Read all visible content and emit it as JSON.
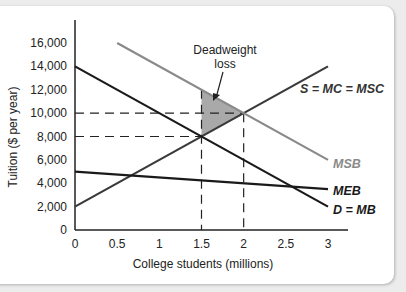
{
  "chart_data": {
    "type": "line",
    "title": "",
    "xlabel": "College students (millions)",
    "ylabel": "Tuition ($ per year)",
    "xlim": [
      0,
      3
    ],
    "ylim": [
      0,
      16000
    ],
    "x_ticks": [
      "0",
      "0.5",
      "1",
      "1.5",
      "2",
      "2.5",
      "3"
    ],
    "y_ticks": [
      "0",
      "2,000",
      "4,000",
      "6,000",
      "8,000",
      "10,000",
      "12,000",
      "14,000",
      "16,000"
    ],
    "grid": false,
    "series": [
      {
        "name": "S = MC = MSC",
        "color": "#3a3a3a",
        "points": [
          [
            0,
            2000
          ],
          [
            3,
            14000
          ]
        ]
      },
      {
        "name": "D = MB",
        "color": "#1a1a1a",
        "points": [
          [
            0,
            14000
          ],
          [
            3,
            2000
          ]
        ]
      },
      {
        "name": "MSB",
        "color": "#8a8a8a",
        "points": [
          [
            0.5,
            16000
          ],
          [
            3,
            6000
          ]
        ]
      },
      {
        "name": "MEB",
        "color": "#1a1a1a",
        "points": [
          [
            0,
            5000
          ],
          [
            3,
            3500
          ]
        ]
      }
    ],
    "reference_lines": [
      {
        "type": "vertical",
        "x": 1.5,
        "style": "dashed"
      },
      {
        "type": "vertical",
        "x": 2,
        "style": "dashed"
      },
      {
        "type": "horizontal",
        "y": 10000,
        "style": "dashed"
      },
      {
        "type": "horizontal",
        "y": 8000,
        "style": "dashed"
      }
    ],
    "shaded_region": {
      "name": "Deadweight loss",
      "points": [
        [
          1.5,
          12000
        ],
        [
          2,
          10000
        ],
        [
          1.5,
          8000
        ]
      ]
    },
    "annotations": [
      {
        "text": "Deadweight loss",
        "points_to": [
          1.7,
          10500
        ]
      }
    ]
  },
  "labels": {
    "smc": "S = MC = MSC",
    "msb": "MSB",
    "meb": "MEB",
    "dmb": "D = MB",
    "dwl_line1": "Deadweight",
    "dwl_line2": "loss"
  }
}
